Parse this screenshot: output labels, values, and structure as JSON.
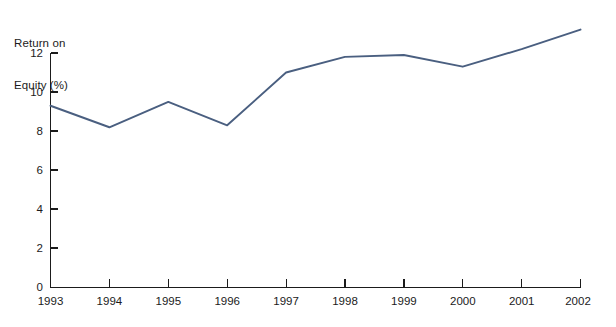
{
  "chart_data": {
    "type": "line",
    "title": "",
    "ylabel": "Return on\nEquity (%)",
    "ylabel_line1": "Return on",
    "ylabel_line2": "Equity (%)",
    "xlabel": "",
    "categories": [
      "1993",
      "1994",
      "1995",
      "1996",
      "1997",
      "1998",
      "1999",
      "2000",
      "2001",
      "2002"
    ],
    "x": [
      1993,
      1994,
      1995,
      1996,
      1997,
      1998,
      1999,
      2000,
      2001,
      2002
    ],
    "values": [
      9.3,
      8.2,
      9.5,
      8.3,
      11.0,
      11.8,
      11.9,
      11.3,
      12.2,
      13.2
    ],
    "series": [
      {
        "name": "Return on Equity (%)",
        "values": [
          9.3,
          8.2,
          9.5,
          8.3,
          11.0,
          11.8,
          11.9,
          11.3,
          12.2,
          13.2
        ]
      }
    ],
    "ylim": [
      0,
      13.6
    ],
    "y_ticks": [
      0,
      2,
      4,
      6,
      8,
      10,
      12
    ],
    "y_tick_labels": [
      "0",
      "2",
      "4",
      "6",
      "8",
      "10",
      "12"
    ],
    "x_ticks": [
      1993,
      1994,
      1995,
      1996,
      1997,
      1998,
      1999,
      2000,
      2001,
      2002
    ],
    "x_tick_labels": [
      "1993",
      "1994",
      "1995",
      "1996",
      "1997",
      "1998",
      "1999",
      "2000",
      "2001",
      "2002"
    ],
    "xlim": [
      1993,
      2002
    ],
    "grid": false,
    "legend": false,
    "legend_position": "none",
    "annotations": [],
    "line_color": "#4a5f80",
    "axis_color": "#1b1b1b",
    "background_color": "#ffffff"
  },
  "axis": {
    "y_title_line1": "Return on",
    "y_title_line2": "Equity (%)"
  },
  "y_labels": {
    "t0": "0",
    "t2": "2",
    "t4": "4",
    "t6": "6",
    "t8": "8",
    "t10": "10",
    "t12": "12"
  },
  "x_labels": {
    "y1993": "1993",
    "y1994": "1994",
    "y1995": "1995",
    "y1996": "1996",
    "y1997": "1997",
    "y1998": "1998",
    "y1999": "1999",
    "y2000": "2000",
    "y2001": "2001",
    "y2002": "2002"
  }
}
